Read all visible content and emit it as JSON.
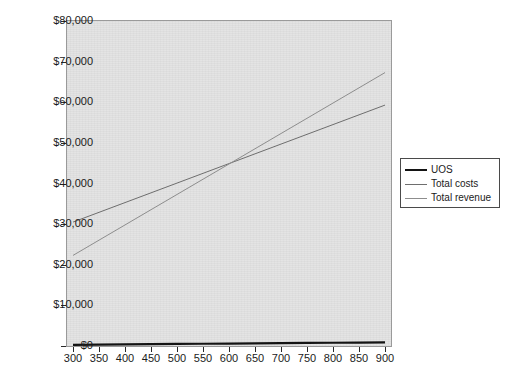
{
  "chart_data": {
    "type": "line",
    "title": "",
    "xlabel": "",
    "ylabel": "",
    "categories": [
      300,
      350,
      400,
      450,
      500,
      550,
      600,
      650,
      700,
      750,
      800,
      850,
      900
    ],
    "x_tick_labels": [
      "300",
      "350",
      "400",
      "450",
      "500",
      "550",
      "600",
      "650",
      "700",
      "750",
      "800",
      "850",
      "900"
    ],
    "y_tick_labels": [
      "$0",
      "$10,000",
      "$20,000",
      "$30,000",
      "$40,000",
      "$50,000",
      "$60,000",
      "$70,000",
      "$80,000"
    ],
    "y_tick_values": [
      0,
      10000,
      20000,
      30000,
      40000,
      50000,
      60000,
      70000,
      80000
    ],
    "ylim": [
      0,
      80000
    ],
    "grid": false,
    "legend_position": "right",
    "plot_background": "#e3e3e3",
    "series": [
      {
        "name": "UOS",
        "color": "#141414",
        "width": 2.2,
        "values": [
          300,
          350,
          400,
          450,
          500,
          550,
          600,
          650,
          700,
          750,
          800,
          850,
          900
        ]
      },
      {
        "name": "Total costs",
        "color": "#6e6e6e",
        "width": 1,
        "values": [
          30500,
          32900,
          35300,
          37700,
          40100,
          42500,
          44900,
          47300,
          49700,
          52100,
          54500,
          56900,
          59300
        ]
      },
      {
        "name": "Total revenue",
        "color": "#8d8d8d",
        "width": 1,
        "values": [
          22300,
          26050,
          29800,
          33550,
          37300,
          41050,
          44800,
          48550,
          52300,
          56050,
          59800,
          63550,
          67300
        ]
      }
    ],
    "annotations": {
      "break_even_note": "Total revenue crosses Total costs near 600 units at about $45,000"
    }
  },
  "legend": {
    "items": [
      {
        "label": "UOS"
      },
      {
        "label": "Total costs"
      },
      {
        "label": "Total revenue"
      }
    ]
  },
  "background_text": {
    "lines": [
      "",
      "",
      "",
      "",
      ""
    ]
  }
}
